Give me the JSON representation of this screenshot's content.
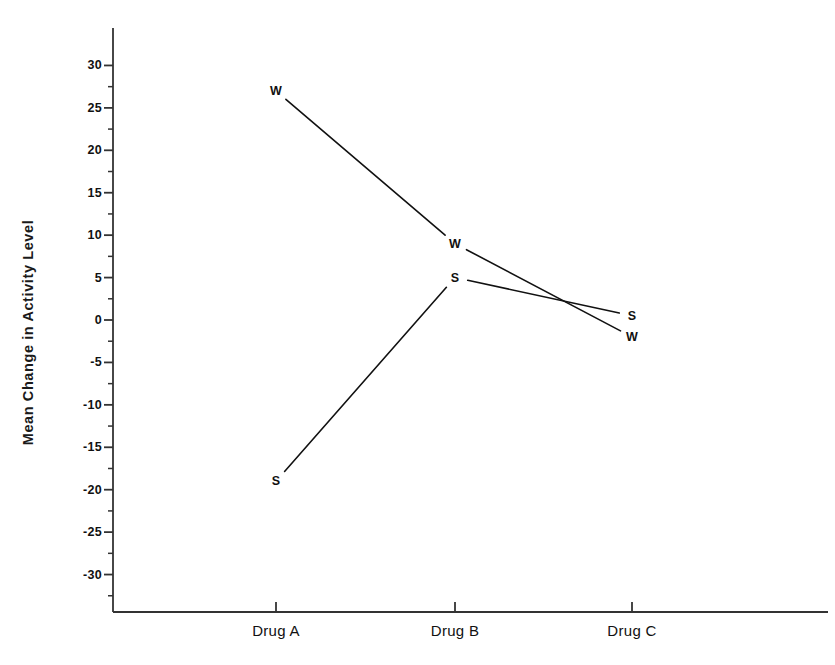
{
  "chart_data": {
    "type": "line",
    "title": "",
    "xlabel": "",
    "ylabel": "Mean Change in Activity Level",
    "categories": [
      "Drug A",
      "Drug B",
      "Drug C"
    ],
    "ylim": [
      -33,
      33
    ],
    "yticks": [
      -30,
      -25,
      -20,
      -15,
      -10,
      -5,
      0,
      5,
      10,
      15,
      20,
      25,
      30
    ],
    "ytick_labels": [
      "-30",
      "-25",
      "-20",
      "-15",
      "-10",
      "-5",
      "0",
      "5",
      "10",
      "15",
      "20",
      "25",
      "30"
    ],
    "grid": false,
    "legend": "none",
    "point_label_style": "series-initial-letter-at-each-point",
    "series": [
      {
        "name": "W",
        "label": "W",
        "marker_text": "W",
        "color": "#111111",
        "values": [
          27,
          9,
          -2
        ]
      },
      {
        "name": "S",
        "label": "S",
        "marker_text": "S",
        "color": "#111111",
        "values": [
          -19,
          5,
          0.5
        ]
      }
    ],
    "annotations": []
  },
  "axes": {
    "y_axis_name": "y-axis",
    "x_axis_name": "x-axis",
    "line_color": "#333333"
  }
}
